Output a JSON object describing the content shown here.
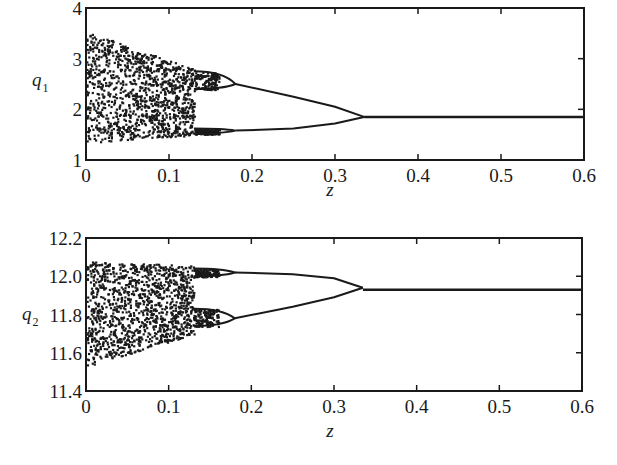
{
  "chart_data": [
    {
      "type": "scatter",
      "subtype": "bifurcation-diagram",
      "title": "",
      "xlabel": "z",
      "ylabel": "q_1",
      "ylabel_main": "q",
      "ylabel_sub": "1",
      "xlim": [
        0,
        0.6
      ],
      "ylim": [
        1,
        4
      ],
      "x_ticks": [
        "0",
        "0.1",
        "0.2",
        "0.3",
        "0.4",
        "0.5",
        "0.6"
      ],
      "y_ticks": [
        "1",
        "2",
        "3",
        "4"
      ],
      "grid": false,
      "legend": null,
      "regions": [
        {
          "name": "chaotic",
          "z_range": [
            0,
            0.13
          ],
          "q_range_at_z0": [
            1.35,
            3.55
          ],
          "q_range_at_end": [
            1.5,
            2.8
          ]
        },
        {
          "name": "period-4",
          "z_range": [
            0.13,
            0.18
          ],
          "branches_at_0.15": [
            2.75,
            2.4,
            1.62,
            1.52
          ]
        },
        {
          "name": "period-2",
          "z_range": [
            0.18,
            0.335
          ],
          "upper_branch": [
            [
              0.18,
              2.5
            ],
            [
              0.25,
              2.25
            ],
            [
              0.3,
              2.05
            ],
            [
              0.335,
              1.85
            ]
          ],
          "lower_branch": [
            [
              0.18,
              1.58
            ],
            [
              0.25,
              1.62
            ],
            [
              0.3,
              1.72
            ],
            [
              0.335,
              1.85
            ]
          ]
        },
        {
          "name": "fixed-point",
          "z_range": [
            0.335,
            0.6
          ],
          "q": 1.85
        }
      ]
    },
    {
      "type": "scatter",
      "subtype": "bifurcation-diagram",
      "title": "",
      "xlabel": "z",
      "ylabel": "q_2",
      "ylabel_main": "q",
      "ylabel_sub": "2",
      "xlim": [
        0,
        0.6
      ],
      "ylim": [
        11.4,
        12.2
      ],
      "x_ticks": [
        "0",
        "0.1",
        "0.2",
        "0.3",
        "0.4",
        "0.5",
        "0.6"
      ],
      "y_ticks": [
        "11.4",
        "11.6",
        "11.8",
        "12.0",
        "12.2"
      ],
      "grid": false,
      "legend": null,
      "regions": [
        {
          "name": "chaotic",
          "z_range": [
            0,
            0.13
          ],
          "q_range_at_z0": [
            11.53,
            12.08
          ],
          "q_range_at_end": [
            11.7,
            12.06
          ]
        },
        {
          "name": "period-4",
          "z_range": [
            0.13,
            0.18
          ],
          "branches_at_0.15": [
            12.04,
            12.0,
            11.83,
            11.74
          ]
        },
        {
          "name": "period-2",
          "z_range": [
            0.18,
            0.335
          ],
          "upper_branch": [
            [
              0.18,
              12.02
            ],
            [
              0.25,
              12.01
            ],
            [
              0.3,
              11.99
            ],
            [
              0.335,
              11.94
            ]
          ],
          "lower_branch": [
            [
              0.18,
              11.78
            ],
            [
              0.25,
              11.84
            ],
            [
              0.3,
              11.89
            ],
            [
              0.335,
              11.94
            ]
          ]
        },
        {
          "name": "fixed-point",
          "z_range": [
            0.335,
            0.6
          ],
          "q": 11.93
        }
      ]
    }
  ],
  "colors": {
    "ink": "#1a1a1a",
    "background": "#ffffff"
  }
}
